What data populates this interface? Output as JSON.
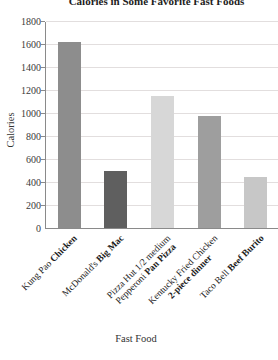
{
  "chart_data": {
    "type": "bar",
    "title": "Calories in Some Favorite Fast Foods",
    "xlabel": "Fast Food",
    "ylabel": "Calories",
    "ylim": [
      0,
      1800
    ],
    "ytick_step": 200,
    "ytick_labels": [
      "0",
      "200",
      "400",
      "600",
      "800",
      "1000",
      "1200",
      "1400",
      "1600",
      "1800"
    ],
    "grid": true,
    "legend": "none",
    "categories": [
      "Kung Pao Chicken",
      "McDonald's Big Mac",
      "Pizza Hut 1/2 medium Pepperoni Pan Pizza",
      "Kentucky Fried Chicken 2-piece dinner",
      "Taco Bell Beef Burito"
    ],
    "values": [
      1620,
      500,
      1150,
      970,
      440
    ],
    "bar_colors": [
      "#8d8d8d",
      "#5f5f5f",
      "#d7d7d7",
      "#9e9e9e",
      "#c7c7c7"
    ],
    "category_label_lines": [
      [
        [
          {
            "text": "Kung Pao ",
            "bold": false
          },
          {
            "text": "Chicken",
            "bold": true
          }
        ]
      ],
      [
        [
          {
            "text": "McDonald's ",
            "bold": false
          },
          {
            "text": "Big Mac",
            "bold": true
          }
        ]
      ],
      [
        [
          {
            "text": "Pizza Hut 1/2 medium",
            "bold": false
          }
        ],
        [
          {
            "text": "Pepperoni ",
            "bold": false
          },
          {
            "text": "Pan Pizza",
            "bold": true
          }
        ]
      ],
      [
        [
          {
            "text": "Kentucky Fried Chicken",
            "bold": false
          }
        ],
        [
          {
            "text": "2-piece dinner",
            "bold": true
          }
        ]
      ],
      [
        [
          {
            "text": "Taco Bell ",
            "bold": false
          },
          {
            "text": "Beef Burito",
            "bold": true
          }
        ]
      ]
    ],
    "colors": {
      "axis": "#8a8a8a",
      "grid": "#e2dede",
      "text": "#2f2f2f"
    }
  }
}
